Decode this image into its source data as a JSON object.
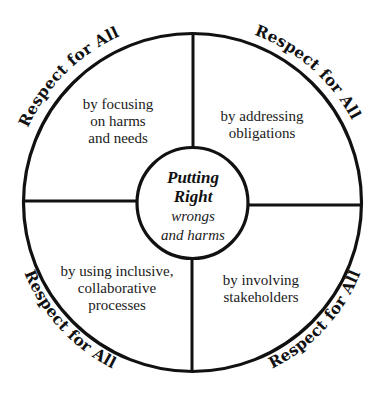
{
  "diagram": {
    "center": {
      "title_line1": "Putting",
      "title_line2": "Right",
      "sub_line1": "wrongs",
      "sub_line2": "and harms"
    },
    "quadrants": [
      {
        "position": "top-left",
        "lines": [
          "by focusing",
          "on harms",
          "and needs"
        ]
      },
      {
        "position": "top-right",
        "lines": [
          "by addressing",
          "obligations"
        ]
      },
      {
        "position": "bottom-left",
        "lines": [
          "by using inclusive,",
          "collaborative",
          "processes"
        ]
      },
      {
        "position": "bottom-right",
        "lines": [
          "by involving",
          "stakeholders"
        ]
      }
    ],
    "arc_labels": [
      {
        "position": "top-left",
        "text": "Respect for All"
      },
      {
        "position": "top-right",
        "text": "Respect for All"
      },
      {
        "position": "bottom-left",
        "text": "Respect for All"
      },
      {
        "position": "bottom-right",
        "text": "Respect for All"
      }
    ],
    "colors": {
      "stroke": "#111111",
      "background": "#ffffff",
      "text": "#1a1a1a"
    }
  }
}
